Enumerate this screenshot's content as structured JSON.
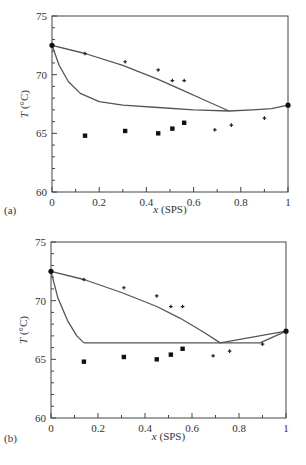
{
  "chart_data": [
    {
      "panel": "(a)",
      "type": "scatter",
      "xlabel": "x (SPS)",
      "ylabel": "T (°C)",
      "xlim": [
        0,
        1
      ],
      "ylim": [
        60,
        75
      ],
      "xticks": [
        "0",
        "0.2",
        "0.4",
        "0.6",
        "0.8",
        "1"
      ],
      "yticks": [
        "60",
        "65",
        "70",
        "75"
      ],
      "grid": false,
      "series": [
        {
          "name": "upper curve (dew)",
          "type": "line",
          "x": [
            0,
            0.14,
            0.3,
            0.45,
            0.55,
            0.65,
            0.75
          ],
          "y": [
            72.5,
            71.8,
            70.8,
            69.6,
            68.7,
            67.8,
            66.9
          ]
        },
        {
          "name": "lower curve (bubble)",
          "type": "line",
          "x": [
            0,
            0.03,
            0.07,
            0.12,
            0.2,
            0.3,
            0.45,
            0.6,
            0.75
          ],
          "y": [
            72.5,
            70.8,
            69.4,
            68.4,
            67.7,
            67.4,
            67.2,
            67.0,
            66.9
          ]
        },
        {
          "name": "right branch",
          "type": "line",
          "x": [
            0.75,
            0.85,
            0.93,
            1.0
          ],
          "y": [
            66.9,
            67.0,
            67.1,
            67.4
          ]
        },
        {
          "name": "pure component points",
          "type": "marker-circle",
          "x": [
            0,
            1
          ],
          "y": [
            72.5,
            67.4
          ]
        },
        {
          "name": "vapor data (+)",
          "type": "marker-plus",
          "x": [
            0.14,
            0.31,
            0.45,
            0.51,
            0.56
          ],
          "y": [
            71.8,
            71.1,
            70.4,
            69.5,
            69.5
          ]
        },
        {
          "name": "liquid data (+)",
          "type": "marker-plus",
          "x": [
            0.69,
            0.76,
            0.9
          ],
          "y": [
            65.3,
            65.7,
            66.3
          ]
        },
        {
          "name": "solid squares",
          "type": "marker-square",
          "x": [
            0.14,
            0.31,
            0.45,
            0.51,
            0.56
          ],
          "y": [
            64.8,
            65.2,
            65.0,
            65.4,
            65.9
          ]
        }
      ]
    },
    {
      "panel": "(b)",
      "type": "scatter",
      "xlabel": "x (SPS)",
      "ylabel": "T (°C)",
      "xlim": [
        0,
        1
      ],
      "ylim": [
        60,
        75
      ],
      "xticks": [
        "0",
        "0.2",
        "0.4",
        "0.6",
        "0.8",
        "1"
      ],
      "yticks": [
        "60",
        "65",
        "70",
        "75"
      ],
      "grid": false,
      "series": [
        {
          "name": "upper curve",
          "type": "line",
          "x": [
            0,
            0.14,
            0.3,
            0.45,
            0.55,
            0.65,
            0.72
          ],
          "y": [
            72.5,
            71.8,
            70.7,
            69.5,
            68.5,
            67.3,
            66.4
          ]
        },
        {
          "name": "left lower curve",
          "type": "line",
          "x": [
            0,
            0.03,
            0.07,
            0.11,
            0.14
          ],
          "y": [
            72.5,
            70.2,
            68.3,
            67.0,
            66.4
          ]
        },
        {
          "name": "eutectic line",
          "type": "line",
          "x": [
            0.14,
            0.89
          ],
          "y": [
            66.4,
            66.4
          ]
        },
        {
          "name": "right upper line",
          "type": "line",
          "x": [
            0.72,
            1.0
          ],
          "y": [
            66.4,
            67.4
          ]
        },
        {
          "name": "right lower line",
          "type": "line",
          "x": [
            0.89,
            1.0
          ],
          "y": [
            66.4,
            67.4
          ]
        },
        {
          "name": "pure component points",
          "type": "marker-circle",
          "x": [
            0,
            1
          ],
          "y": [
            72.5,
            67.4
          ]
        },
        {
          "name": "vapor data (+)",
          "type": "marker-plus",
          "x": [
            0.14,
            0.31,
            0.45,
            0.51,
            0.56
          ],
          "y": [
            71.8,
            71.1,
            70.4,
            69.5,
            69.5
          ]
        },
        {
          "name": "liquid data (+)",
          "type": "marker-plus",
          "x": [
            0.69,
            0.76,
            0.9
          ],
          "y": [
            65.3,
            65.7,
            66.3
          ]
        },
        {
          "name": "solid squares",
          "type": "marker-square",
          "x": [
            0.14,
            0.31,
            0.45,
            0.51,
            0.56
          ],
          "y": [
            64.8,
            65.2,
            65.0,
            65.4,
            65.9
          ]
        }
      ]
    }
  ],
  "panels": [
    {
      "label": "(a)",
      "xlabel": "x (SPS)",
      "ylabel": "T (°C)"
    },
    {
      "label": "(b)",
      "xlabel": "x (SPS)",
      "ylabel": "T (°C)"
    }
  ]
}
